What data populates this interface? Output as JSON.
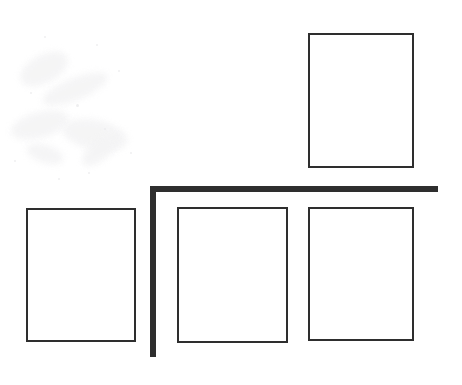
{
  "document": {
    "title": "Frame Layout Diagram",
    "kind": "scanned-line-drawing",
    "canvas": {
      "width": 462,
      "height": 385
    },
    "background_color": "#ffffff",
    "ink_color": "#2e2e2e"
  },
  "style": {
    "frame_border_color": "#2e2e2e",
    "frame_border_width_px": 2,
    "frame_fill_color": "#ffffff",
    "bold_line_color": "#2e2e2e",
    "bold_line_thickness_px": 6
  },
  "shapes": {
    "frames": [
      {
        "name": "frame-top-right",
        "label": "",
        "x": 308,
        "y": 33,
        "width": 106,
        "height": 135,
        "border_width": 2
      },
      {
        "name": "frame-bottom-left",
        "label": "",
        "x": 26,
        "y": 208,
        "width": 110,
        "height": 134,
        "border_width": 2
      },
      {
        "name": "frame-bottom-middle",
        "label": "",
        "x": 177,
        "y": 207,
        "width": 111,
        "height": 136,
        "border_width": 2
      },
      {
        "name": "frame-bottom-right",
        "label": "",
        "x": 308,
        "y": 207,
        "width": 106,
        "height": 134,
        "border_width": 2
      }
    ],
    "bold_lines": [
      {
        "name": "bold-horizontal-rule",
        "orientation": "horizontal",
        "x": 150,
        "y": 186,
        "length": 288,
        "thickness": 6
      },
      {
        "name": "bold-vertical-rule",
        "orientation": "vertical",
        "x": 150,
        "y": 186,
        "length": 171,
        "thickness": 6
      }
    ]
  },
  "noise": {
    "smudges": [
      {
        "x": 18,
        "y": 55,
        "w": 52,
        "h": 28,
        "rot": -28
      },
      {
        "x": 40,
        "y": 78,
        "w": 70,
        "h": 22,
        "rot": -22
      },
      {
        "x": 10,
        "y": 112,
        "w": 60,
        "h": 26,
        "rot": -15
      },
      {
        "x": 62,
        "y": 120,
        "w": 66,
        "h": 30,
        "rot": 12
      },
      {
        "x": 78,
        "y": 140,
        "w": 44,
        "h": 20,
        "rot": -40
      },
      {
        "x": 26,
        "y": 145,
        "w": 38,
        "h": 18,
        "rot": 18
      }
    ],
    "specks": [
      {
        "x": 44,
        "y": 36,
        "d": 2
      },
      {
        "x": 96,
        "y": 44,
        "d": 2
      },
      {
        "x": 118,
        "y": 70,
        "d": 2
      },
      {
        "x": 30,
        "y": 92,
        "d": 2
      },
      {
        "x": 76,
        "y": 104,
        "d": 3
      },
      {
        "x": 104,
        "y": 128,
        "d": 2
      },
      {
        "x": 14,
        "y": 160,
        "d": 2
      },
      {
        "x": 88,
        "y": 172,
        "d": 2
      },
      {
        "x": 130,
        "y": 152,
        "d": 2
      },
      {
        "x": 58,
        "y": 178,
        "d": 2
      }
    ]
  }
}
